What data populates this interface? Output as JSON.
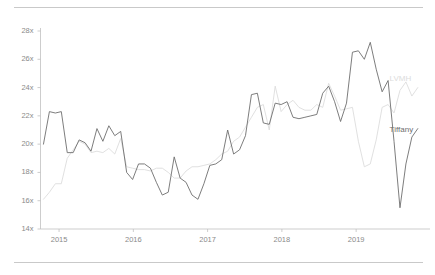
{
  "chart_data": {
    "type": "line",
    "title": "",
    "subtitle": "",
    "xlabel": "",
    "ylabel": "",
    "xlim": [
      2014.75,
      2019.9
    ],
    "ylim": [
      14,
      28
    ],
    "grid": false,
    "legend_position": "inline-right",
    "y_ticks": [
      14,
      16,
      18,
      20,
      22,
      24,
      26,
      28
    ],
    "y_tick_labels": [
      "14x",
      "16x",
      "18x",
      "20x",
      "22x",
      "24x",
      "26x",
      "28x"
    ],
    "x_ticks": [
      2015,
      2016,
      2017,
      2018,
      2019
    ],
    "x_tick_labels": [
      "2015",
      "2016",
      "2017",
      "2018",
      "2019"
    ],
    "series": [
      {
        "name": "Tiffany",
        "color": "#6e6e6e",
        "label_x": 2019.45,
        "label_y": 21.0,
        "x": [
          2014.79,
          2014.87,
          2014.95,
          2015.03,
          2015.11,
          2015.19,
          2015.27,
          2015.35,
          2015.43,
          2015.51,
          2015.59,
          2015.67,
          2015.75,
          2015.83,
          2015.91,
          2015.99,
          2016.07,
          2016.15,
          2016.23,
          2016.31,
          2016.39,
          2016.47,
          2016.55,
          2016.63,
          2016.71,
          2016.79,
          2016.87,
          2016.95,
          2017.03,
          2017.11,
          2017.19,
          2017.27,
          2017.35,
          2017.43,
          2017.51,
          2017.59,
          2017.67,
          2017.75,
          2017.83,
          2017.91,
          2017.99,
          2018.07,
          2018.15,
          2018.23,
          2018.31,
          2018.39,
          2018.47,
          2018.55,
          2018.63,
          2018.71,
          2018.79,
          2018.87,
          2018.95,
          2019.03,
          2019.11,
          2019.19,
          2019.27,
          2019.35,
          2019.43,
          2019.51,
          2019.59,
          2019.67,
          2019.75,
          2019.83
        ],
        "y": [
          20.0,
          22.3,
          22.2,
          22.3,
          19.4,
          19.4,
          20.3,
          20.1,
          19.5,
          21.1,
          20.2,
          21.3,
          20.6,
          20.9,
          18.0,
          17.5,
          18.6,
          18.6,
          18.3,
          17.3,
          16.4,
          16.6,
          19.1,
          17.6,
          17.3,
          16.4,
          16.1,
          17.2,
          18.5,
          18.6,
          18.9,
          21.0,
          19.3,
          19.6,
          20.6,
          23.5,
          23.6,
          21.5,
          21.4,
          22.9,
          22.8,
          23.0,
          21.9,
          21.8,
          21.9,
          22.0,
          22.1,
          23.6,
          24.1,
          23.0,
          21.6,
          22.9,
          26.5,
          26.6,
          26.0,
          27.2,
          25.3,
          23.7,
          24.5,
          20.2,
          15.5,
          18.6,
          20.5,
          21.1
        ]
      },
      {
        "name": "LVMH",
        "color": "#dcdcdc",
        "label_x": 2019.45,
        "label_y": 24.6,
        "x": [
          2014.79,
          2014.87,
          2014.95,
          2015.03,
          2015.11,
          2015.19,
          2015.27,
          2015.35,
          2015.43,
          2015.51,
          2015.59,
          2015.67,
          2015.75,
          2015.83,
          2015.91,
          2015.99,
          2016.07,
          2016.15,
          2016.23,
          2016.31,
          2016.39,
          2016.47,
          2016.55,
          2016.63,
          2016.71,
          2016.79,
          2016.87,
          2016.95,
          2017.03,
          2017.11,
          2017.19,
          2017.27,
          2017.35,
          2017.43,
          2017.51,
          2017.59,
          2017.67,
          2017.75,
          2017.83,
          2017.91,
          2017.99,
          2018.07,
          2018.15,
          2018.23,
          2018.31,
          2018.39,
          2018.47,
          2018.55,
          2018.63,
          2018.71,
          2018.79,
          2018.87,
          2018.95,
          2019.03,
          2019.11,
          2019.19,
          2019.27,
          2019.35,
          2019.43,
          2019.51,
          2019.59,
          2019.67,
          2019.75,
          2019.83
        ],
        "y": [
          16.1,
          16.6,
          17.2,
          17.2,
          19.0,
          19.6,
          20.2,
          20.0,
          19.4,
          19.5,
          19.4,
          19.7,
          19.3,
          20.4,
          18.4,
          18.3,
          18.2,
          18.2,
          18.1,
          18.3,
          18.3,
          18.0,
          17.6,
          17.6,
          18.1,
          18.4,
          18.4,
          18.5,
          18.6,
          18.9,
          19.3,
          19.5,
          20.2,
          20.5,
          21.2,
          21.9,
          22.6,
          22.8,
          21.0,
          24.1,
          22.3,
          22.8,
          23.1,
          22.6,
          22.4,
          22.4,
          22.8,
          22.6,
          24.3,
          23.4,
          22.4,
          22.5,
          22.6,
          20.2,
          18.4,
          18.6,
          20.3,
          22.6,
          22.8,
          22.2,
          23.8,
          24.4,
          23.4,
          24.0
        ]
      }
    ]
  },
  "axes": {
    "spine_color": "#c0c0c0",
    "tick_color": "#c0c0c0",
    "tick_label_color": "#8a8a8a"
  },
  "rules": {
    "top": "horizontal-rule",
    "bottom": "horizontal-rule",
    "color": "#c9c9c9"
  }
}
